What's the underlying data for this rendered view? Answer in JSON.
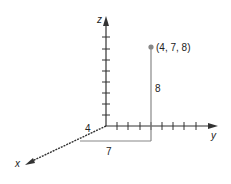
{
  "diagram": {
    "type": "3d-coordinate-point",
    "axes": {
      "x": {
        "label": "x"
      },
      "y": {
        "label": "y"
      },
      "z": {
        "label": "z"
      }
    },
    "point": {
      "label": "(4, 7, 8)",
      "coordinates": [
        4,
        7,
        8
      ]
    },
    "dimension_labels": {
      "x_length": "4",
      "y_length": "7",
      "z_length": "8"
    },
    "colors": {
      "axes": "#333333",
      "guide_lines": "#888888",
      "point": "#888888"
    }
  }
}
